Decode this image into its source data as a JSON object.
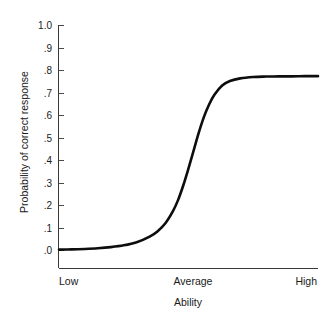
{
  "chart_data": {
    "type": "line",
    "title": "",
    "subtitle": "",
    "xlabel": "Ability",
    "ylabel": "Probability of correct response",
    "grid": false,
    "legend": "none",
    "xlim": [
      0,
      1
    ],
    "ylim": [
      0,
      1
    ],
    "x_tick_labels": [
      "Low",
      "Average",
      "High"
    ],
    "x_tick_positions": [
      0.0,
      0.5,
      1.0
    ],
    "y_tick_labels": [
      "1.0",
      ".9",
      ".8",
      ".7",
      ".6",
      ".5",
      ".4",
      ".3",
      ".2",
      ".1",
      ".0"
    ],
    "y_tick_values": [
      1.0,
      0.9,
      0.8,
      0.7,
      0.6,
      0.5,
      0.4,
      0.3,
      0.2,
      0.1,
      0.0
    ],
    "series": [
      {
        "name": "item characteristic curve",
        "color": "#0d0d0d",
        "upper_asymptote": 0.775,
        "lower_asymptote": 0.0,
        "inflection_x": 0.515,
        "x": [
          0.0,
          0.05,
          0.1,
          0.15,
          0.2,
          0.25,
          0.3,
          0.35,
          0.38,
          0.41,
          0.44,
          0.46,
          0.48,
          0.5,
          0.52,
          0.54,
          0.56,
          0.58,
          0.6,
          0.63,
          0.66,
          0.7,
          0.75,
          0.8,
          0.85,
          0.9,
          0.95,
          1.0
        ],
        "y": [
          0.004,
          0.005,
          0.007,
          0.01,
          0.015,
          0.023,
          0.037,
          0.062,
          0.085,
          0.12,
          0.175,
          0.225,
          0.29,
          0.365,
          0.445,
          0.525,
          0.595,
          0.65,
          0.692,
          0.733,
          0.753,
          0.765,
          0.771,
          0.773,
          0.774,
          0.774,
          0.775,
          0.775
        ]
      }
    ]
  },
  "axes": {
    "y_title": "Probability of correct response",
    "x_title": "Ability",
    "y_ticks": [
      {
        "label": "1.0",
        "value": 1.0
      },
      {
        "label": ".9",
        "value": 0.9
      },
      {
        "label": ".8",
        "value": 0.8
      },
      {
        "label": ".7",
        "value": 0.7
      },
      {
        "label": ".6",
        "value": 0.6
      },
      {
        "label": ".5",
        "value": 0.5
      },
      {
        "label": ".4",
        "value": 0.4
      },
      {
        "label": ".3",
        "value": 0.3
      },
      {
        "label": ".2",
        "value": 0.2
      },
      {
        "label": ".1",
        "value": 0.1
      },
      {
        "label": ".0",
        "value": 0.0
      }
    ],
    "x_ticks": [
      {
        "label": "Low",
        "value": 0.0
      },
      {
        "label": "Average",
        "value": 0.5
      },
      {
        "label": "High",
        "value": 1.0
      }
    ]
  },
  "colors": {
    "curve": "#0d0d0d",
    "axis": "#3a3a3a",
    "text": "#1a1a1a",
    "background": "#ffffff"
  }
}
